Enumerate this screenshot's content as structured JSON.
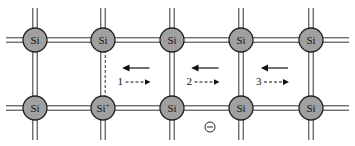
{
  "diagram": {
    "atoms": [
      {
        "label": "Si",
        "col": 0,
        "row": 0
      },
      {
        "label": "Si",
        "col": 1,
        "row": 0
      },
      {
        "label": "Si",
        "col": 2,
        "row": 0
      },
      {
        "label": "Si",
        "col": 3,
        "row": 0
      },
      {
        "label": "Si",
        "col": 4,
        "row": 0
      },
      {
        "label": "Si",
        "col": 0,
        "row": 1
      },
      {
        "label": "Si",
        "sup": "+",
        "col": 1,
        "row": 1
      },
      {
        "label": "Si",
        "col": 2,
        "row": 1
      },
      {
        "label": "Si",
        "col": 3,
        "row": 1
      },
      {
        "label": "Si",
        "col": 4,
        "row": 1
      }
    ],
    "column_x": [
      35,
      103,
      172,
      241,
      311
    ],
    "row_y": [
      40,
      108
    ],
    "broken_bond": {
      "between": [
        [
          1,
          0
        ],
        [
          1,
          1
        ]
      ],
      "style": "dashed"
    },
    "steps": [
      {
        "number": "1",
        "solid_arrow": "left",
        "dashed_arrow": "right"
      },
      {
        "number": "2",
        "solid_arrow": "left",
        "dashed_arrow": "right"
      },
      {
        "number": "3",
        "solid_arrow": "left",
        "dashed_arrow": "right"
      }
    ],
    "electron_symbol": "⊖",
    "colors": {
      "atom_fill": "#a0a0a0",
      "line": "#333333",
      "background": "#ffffff"
    }
  }
}
